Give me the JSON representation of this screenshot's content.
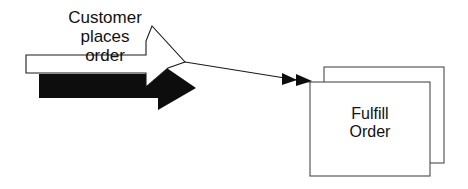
{
  "diagram": {
    "type": "process-flow",
    "background_color": "#ffffff",
    "arrow_shape": {
      "name": "customer-places-order-arrow",
      "style": "block-arrow-with-drop-shadow",
      "fill_color": "#ffffff",
      "outline_color": "#1a1a1a",
      "shadow_color": "#0d0d0d",
      "label_lines": [
        "Customer",
        "places",
        "order"
      ]
    },
    "connector": {
      "name": "flow-connector",
      "line_color": "#1a1a1a",
      "arrowhead_style": "double-solid-triangle",
      "arrowhead_color": "#0d0d0d",
      "arrowhead_count": 2
    },
    "process_box": {
      "name": "fulfill-order-box",
      "style": "stacked-rectangles",
      "stack_count": 2,
      "fill_color": "#ffffff",
      "outline_color": "#4a4a4a",
      "label_lines": [
        "Fulfill",
        "Order"
      ]
    }
  }
}
